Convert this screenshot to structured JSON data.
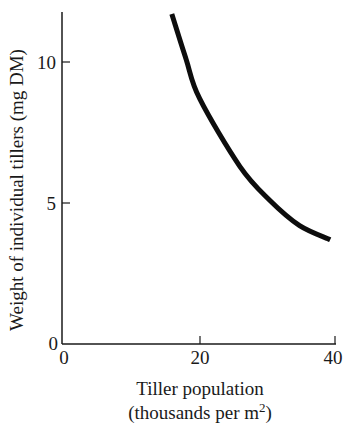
{
  "chart_data": {
    "type": "line",
    "title": "",
    "xlabel": "Tiller population",
    "xlabel_line2": "(thousands per m",
    "xlabel_sup": "2",
    "xlabel_close": ")",
    "ylabel": "Weight of individual tillers (mg DM)",
    "xlim": [
      0,
      40
    ],
    "ylim": [
      0,
      12
    ],
    "xticks": [
      "0",
      "20",
      "40"
    ],
    "yticks": [
      "0",
      "5",
      "10"
    ],
    "grid": false,
    "legend": null,
    "series": [
      {
        "name": "tiller weight",
        "x": [
          16.0,
          18.1,
          20.1,
          26.0,
          30.4,
          34.8,
          39.3
        ],
        "y": [
          11.7,
          10.1,
          8.7,
          6.3,
          5.1,
          4.2,
          3.7
        ]
      }
    ]
  }
}
